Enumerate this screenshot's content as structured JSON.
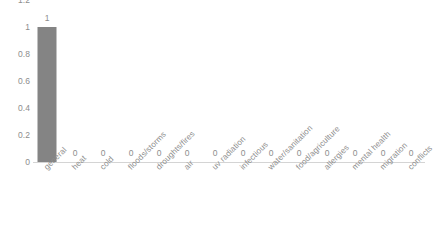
{
  "chart_data": {
    "type": "bar",
    "title": "",
    "subtitle": "",
    "xlabel": "",
    "ylabel": "",
    "categories": [
      "general",
      "heat",
      "cold",
      "floods/storms",
      "droughts/fires",
      "air",
      "uv radiation",
      "infectious",
      "water/sanitation",
      "food/agriculture",
      "allergies",
      "mental health",
      "migration",
      "conflicts"
    ],
    "values": [
      1,
      0,
      0,
      0,
      0,
      0,
      0,
      0,
      0,
      0,
      0,
      0,
      0,
      0
    ],
    "data_labels": [
      "1",
      "0",
      "0",
      "0",
      "0",
      "0",
      "0",
      "0",
      "0",
      "0",
      "0",
      "0",
      "0",
      "0"
    ],
    "ylim": [
      0,
      1.2
    ],
    "y_ticks": [
      0,
      0.2,
      0.4,
      0.6,
      0.8,
      1,
      1.2
    ],
    "y_tick_labels": [
      "0",
      "0.2",
      "0.4",
      "0.6",
      "0.8",
      "1",
      "1.2"
    ],
    "grid": false,
    "legend": null,
    "legend_position": "none",
    "series_color": "#848484",
    "axis_color": "#d4d4d4",
    "text_color": "#8d8d8d"
  }
}
